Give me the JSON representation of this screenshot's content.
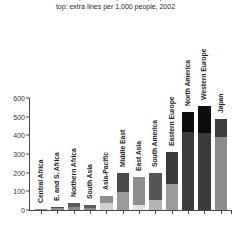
{
  "title": {
    "line1": "bottom: telephone lines per 1,000 people, 2002",
    "line2": "top: extra lines per 1,000 people, 2002"
  },
  "chart_data": {
    "type": "bar",
    "stacked": true,
    "title": "top: extra lines per 1,000 people, 2002",
    "xlabel": "",
    "ylabel": "",
    "ylim": [
      0,
      600
    ],
    "yticks": [
      0,
      100,
      200,
      300,
      400,
      500,
      600
    ],
    "ytick_labels": [
      "0",
      "100",
      "200",
      "300",
      "400",
      "500",
      "600"
    ],
    "grid": false,
    "legend": "none",
    "categories": [
      "Central Africa",
      "E. and S. Africa",
      "Northern Africa",
      "South Asia",
      "Asia-Pacific",
      "Middle East",
      "East Asia",
      "South America",
      "Eastern Europe",
      "North America",
      "Western Europe",
      "Japan"
    ],
    "series": [
      {
        "name": "telephone lines per 1,000 people",
        "color": "#8c8c8c",
        "values": [
          3,
          10,
          14,
          12,
          36,
          96,
          26,
          56,
          140,
          420,
          415,
          392
        ]
      },
      {
        "name": "extra lines per 1,000 people",
        "color": "#4a4a4a",
        "values": [
          1,
          4,
          21,
          13,
          40,
          104,
          150,
          140,
          170,
          0,
          0,
          98
        ]
      },
      {
        "name": "extra lines (black cap)",
        "color": "#0d0d0d",
        "values": [
          0,
          0,
          0,
          0,
          0,
          0,
          0,
          0,
          0,
          105,
          140,
          0
        ]
      }
    ],
    "totals": [
      4,
      14,
      35,
      25,
      76,
      200,
      176,
      196,
      310,
      525,
      555,
      490
    ],
    "bar_colors": [
      {
        "base": "#8c8c8c",
        "top": "#4f4f4f"
      },
      {
        "base": "#8c8c8c",
        "top": "#4f4f4f"
      },
      {
        "base": "#8a8a8a",
        "top": "#5a5a5a"
      },
      {
        "base": "#8a8a8a",
        "top": "#5a5a5a"
      },
      {
        "base": "#cfcfcf",
        "top": "#8f8f8f"
      },
      {
        "base": "#9a9a9a",
        "top": "#4a4a4a"
      },
      {
        "base": "#e2e2e2",
        "top": "#8d8d8d"
      },
      {
        "base": "#b4b4b4",
        "top": "#565656"
      },
      {
        "base": "#9b9b9b",
        "top": "#3a3a3a"
      },
      {
        "base": "#3c3c3c",
        "top": "#0d0d0d"
      },
      {
        "base": "#3a3a3a",
        "top": "#0d0d0d"
      },
      {
        "base": "#8b8b8b",
        "top": "#3e3e3e"
      }
    ]
  },
  "colors": {
    "axis": "#4a4a4a",
    "text": "#1c1c1c",
    "background": "#ffffff"
  }
}
